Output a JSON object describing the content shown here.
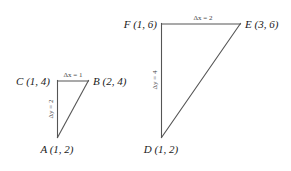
{
  "figure": {
    "background_color": "#ffffff",
    "line_color": "#555555",
    "text_color": "#1a1a1a",
    "delta_text_color": "#444444"
  },
  "triangles": [
    {
      "id": "left-triangle",
      "vertices": [
        {
          "name": "C",
          "label": "C (1, 4)",
          "point_label": "C",
          "coords": "(1, 4)"
        },
        {
          "name": "B",
          "label": "B (2, 4)",
          "point_label": "B",
          "coords": "(2, 4)"
        },
        {
          "name": "A",
          "label": "A (1, 2)",
          "point_label": "A",
          "coords": "(1, 2)"
        }
      ],
      "delta_x_label": "Δx = 1",
      "delta_y_label": "Δy = 2"
    },
    {
      "id": "right-triangle",
      "vertices": [
        {
          "name": "F",
          "label": "F (1, 6)",
          "point_label": "F",
          "coords": "(1, 6)"
        },
        {
          "name": "E",
          "label": "E (3, 6)",
          "point_label": "E",
          "coords": "(3, 6)"
        },
        {
          "name": "D",
          "label": "D (1, 2)",
          "point_label": "D",
          "coords": "(1, 2)"
        }
      ],
      "delta_x_label": "Δx = 2",
      "delta_y_label": "Δy = 4"
    }
  ],
  "labels": {
    "left_C": "C (1, 4)",
    "left_B": "B (2, 4)",
    "left_A": "A (1, 2)",
    "left_dx": "Δx = 1",
    "left_dy": "Δy = 2",
    "right_F": "F (1, 6)",
    "right_E": "E (3, 6)",
    "right_D": "D (1, 2)",
    "right_dx": "Δx = 2",
    "right_dy": "Δy = 4"
  }
}
